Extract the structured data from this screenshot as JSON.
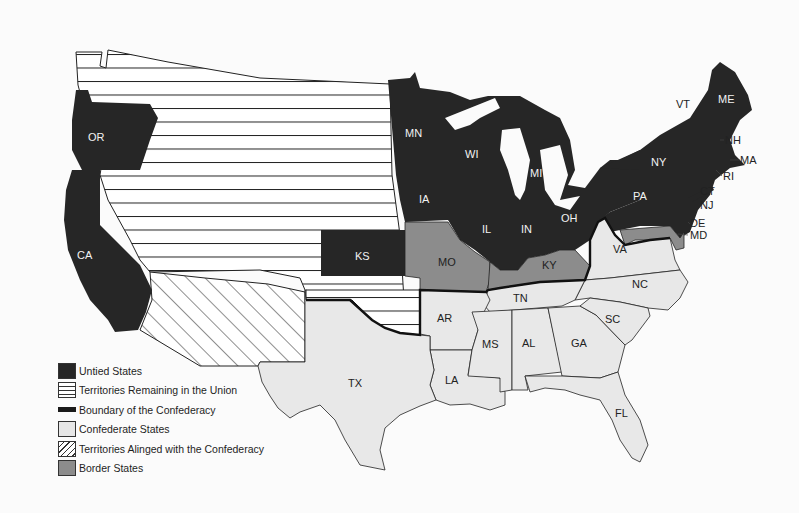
{
  "colors": {
    "union": "#262626",
    "territory_union": "#ffffff",
    "confederate": "#e8e8e8",
    "border_states": "#8c8c8c",
    "boundary": "#1a1a1a",
    "background": "#fbfbfb"
  },
  "legend": {
    "items": [
      {
        "key": "union",
        "label": "Untied States",
        "swatch": "solid-dark"
      },
      {
        "key": "territory_union",
        "label": "Territories Remaining in the Union",
        "swatch": "horizontal-stripes"
      },
      {
        "key": "boundary",
        "label": "Boundary of the Confederacy",
        "swatch": "thick-line"
      },
      {
        "key": "confederate",
        "label": "Confederate States",
        "swatch": "solid-light"
      },
      {
        "key": "territory_confederate",
        "label": "Territories Alinged with the Confederacy",
        "swatch": "diagonal-stripes"
      },
      {
        "key": "border",
        "label": "Border States",
        "swatch": "solid-mid"
      }
    ]
  },
  "states": {
    "union": [
      "OR",
      "CA",
      "KS",
      "MN",
      "WI",
      "IA",
      "MI",
      "IL",
      "IN",
      "OH",
      "PA",
      "NY",
      "VT",
      "ME",
      "NH",
      "MA",
      "RI",
      "CT",
      "NJ"
    ],
    "border": [
      "MO",
      "KY",
      "DE",
      "MD"
    ],
    "confederate": [
      "VA",
      "NC",
      "TN",
      "AR",
      "SC",
      "MS",
      "AL",
      "GA",
      "TX",
      "LA",
      "FL"
    ]
  },
  "labels": {
    "OR": "OR",
    "CA": "CA",
    "KS": "KS",
    "MN": "MN",
    "WI": "WI",
    "IA": "IA",
    "MI": "MI",
    "IL": "IL",
    "IN": "IN",
    "OH": "OH",
    "PA": "PA",
    "NY": "NY",
    "VT": "VT",
    "ME": "ME",
    "NH": "NH",
    "MA": "MA",
    "RI": "RI",
    "CT": "CT",
    "NJ": "NJ",
    "DE": "DE",
    "MD": "MD",
    "MO": "MO",
    "KY": "KY",
    "VA": "VA",
    "NC": "NC",
    "TN": "TN",
    "AR": "AR",
    "SC": "SC",
    "MS": "MS",
    "AL": "AL",
    "GA": "GA",
    "TX": "TX",
    "LA": "LA",
    "FL": "FL"
  }
}
